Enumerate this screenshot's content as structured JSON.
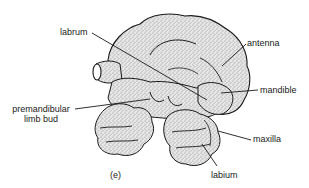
{
  "figure": {
    "panel_label": "(e)",
    "labels": {
      "labrum": "labrum",
      "antenna": "antenna",
      "mandible": "mandible",
      "premandibular_line1": "premandibular",
      "premandibular_line2": "limb bud",
      "maxilla": "maxilla",
      "labium": "labium"
    },
    "colors": {
      "ink": "#1a1a1a",
      "stipple_fill": "#d6d6d6",
      "background": "#ffffff"
    }
  }
}
